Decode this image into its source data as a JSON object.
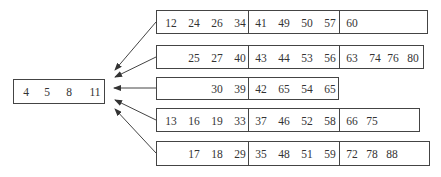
{
  "diagram": {
    "type": "node-link",
    "root": {
      "keys": [
        "4",
        "5",
        "8",
        "11"
      ]
    },
    "children": [
      {
        "segments": [
          [
            "12",
            "24",
            "26",
            "34"
          ],
          [
            "41",
            "49",
            "50",
            "57"
          ],
          [
            "60"
          ]
        ]
      },
      {
        "segments": [
          [
            "25",
            "27",
            "40"
          ],
          [
            "43",
            "44",
            "53",
            "56"
          ],
          [
            "63",
            "74",
            "76",
            "80"
          ]
        ]
      },
      {
        "segments": [
          [
            "30",
            "39"
          ],
          [
            "42",
            "65",
            "54",
            "65"
          ]
        ]
      },
      {
        "segments": [
          [
            "13",
            "16",
            "19",
            "33"
          ],
          [
            "37",
            "46",
            "52",
            "58"
          ],
          [
            "66",
            "75"
          ]
        ]
      },
      {
        "segments": [
          [
            "17",
            "18",
            "29"
          ],
          [
            "35",
            "48",
            "51",
            "59"
          ],
          [
            "72",
            "78",
            "88"
          ]
        ]
      }
    ],
    "edges": [
      {
        "from": "child-1",
        "to": "root"
      },
      {
        "from": "child-2",
        "to": "root"
      },
      {
        "from": "child-3",
        "to": "root"
      },
      {
        "from": "child-4",
        "to": "root"
      },
      {
        "from": "child-5",
        "to": "root"
      }
    ],
    "colors": {
      "line": "#444444",
      "text": "#333333",
      "background": "#ffffff"
    }
  }
}
